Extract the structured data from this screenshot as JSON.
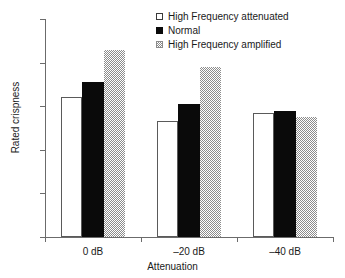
{
  "chart_data": {
    "type": "bar",
    "title": "",
    "xlabel": "Attenuation",
    "ylabel": "Rated crispness",
    "categories": [
      "0 dB",
      "–20 dB",
      "–40 dB"
    ],
    "series": [
      {
        "name": "High Frequency attenuated",
        "values": [
          64,
          53,
          57
        ],
        "swatch": "white-outlined-square"
      },
      {
        "name": "Normal",
        "values": [
          71,
          61,
          58
        ],
        "swatch": "black-filled-square"
      },
      {
        "name": "High Frequency amplified",
        "values": [
          86,
          78,
          55
        ],
        "swatch": "gray-checkered-square"
      }
    ],
    "ylim": [
      0,
      100
    ],
    "yticks": [
      0,
      20,
      40,
      60,
      80,
      100
    ],
    "ytick_labels": [
      "0",
      "20",
      "40",
      "60",
      "80",
      "100"
    ],
    "grid": false,
    "legend_position": "top-right-inside",
    "colors": {
      "series_0": "#ffffff",
      "series_1": "#0a0a0a",
      "series_2": "#8c8c8c",
      "axis": "#6b6b6b",
      "text": "#1a1a1a",
      "background": "#ffffff"
    }
  }
}
